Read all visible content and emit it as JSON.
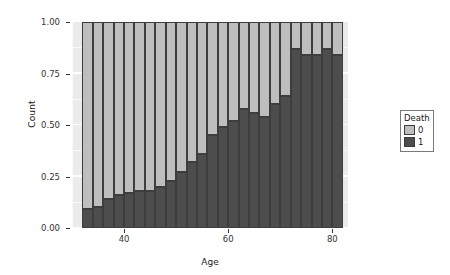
{
  "chart_data": {
    "type": "bar",
    "stacked": true,
    "position": "fill",
    "title": "",
    "xlabel": "Age",
    "ylabel": "Count",
    "xlim": [
      30,
      83
    ],
    "ylim": [
      0,
      1
    ],
    "xticks": [
      40,
      60,
      80
    ],
    "xtick_labels": [
      "40",
      "60",
      "80"
    ],
    "yticks": [
      0.0,
      0.25,
      0.5,
      0.75,
      1.0
    ],
    "ytick_labels": [
      "0.00",
      "0.25",
      "0.50",
      "0.75",
      "1.00"
    ],
    "grid": true,
    "legend": {
      "title": "Death",
      "position": "right",
      "entries": [
        {
          "label": "0",
          "color": "#bebebe"
        },
        {
          "label": "1",
          "color": "#4d4d4d"
        }
      ]
    },
    "x": [
      33,
      35,
      37,
      39,
      41,
      43,
      45,
      47,
      49,
      51,
      53,
      55,
      57,
      59,
      61,
      63,
      65,
      67,
      69,
      71,
      73,
      75,
      77,
      79,
      81
    ],
    "series": [
      {
        "name": "1",
        "color": "#4d4d4d",
        "values": [
          0.09,
          0.1,
          0.14,
          0.16,
          0.17,
          0.18,
          0.18,
          0.2,
          0.23,
          0.27,
          0.32,
          0.36,
          0.45,
          0.49,
          0.52,
          0.58,
          0.56,
          0.54,
          0.6,
          0.64,
          0.87,
          0.84,
          0.84,
          0.87,
          0.84
        ]
      },
      {
        "name": "0",
        "color": "#bebebe",
        "values": [
          0.91,
          0.9,
          0.86,
          0.84,
          0.83,
          0.82,
          0.82,
          0.8,
          0.77,
          0.73,
          0.68,
          0.64,
          0.55,
          0.51,
          0.48,
          0.42,
          0.44,
          0.46,
          0.4,
          0.36,
          0.13,
          0.16,
          0.16,
          0.13,
          0.16
        ]
      }
    ]
  },
  "theme": {
    "panel_background": "#ebebeb",
    "grid_color": "#ffffff",
    "figure_background": "#ffffff",
    "text_color": "#1a1a1a",
    "bar_outline": "#3d3d3d"
  }
}
